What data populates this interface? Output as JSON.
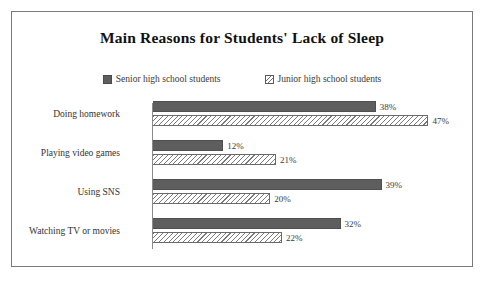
{
  "chart_data": {
    "type": "bar",
    "orientation": "horizontal",
    "title": "Main Reasons for Students' Lack of Sleep",
    "xlabel": "",
    "ylabel": "",
    "xlim": [
      0,
      50
    ],
    "grid": false,
    "legend_position": "top-center",
    "categories": [
      "Doing homework",
      "Playing video games",
      "Using SNS",
      "Watching TV or movies"
    ],
    "series": [
      {
        "name": "Senior high school students",
        "marker": "solid-gray-square",
        "color": "#5e5e5e",
        "values": [
          38,
          12,
          39,
          32
        ],
        "labels": [
          "38%",
          "12%",
          "39%",
          "32%"
        ]
      },
      {
        "name": "Junior high school students",
        "marker": "diagonal-hatch-square",
        "color": "#7b7b7b",
        "values": [
          47,
          21,
          20,
          22
        ],
        "labels": [
          "47%",
          "21%",
          "20%",
          "22%"
        ]
      }
    ]
  },
  "frame": {
    "border_color": "#7a7a7a"
  }
}
